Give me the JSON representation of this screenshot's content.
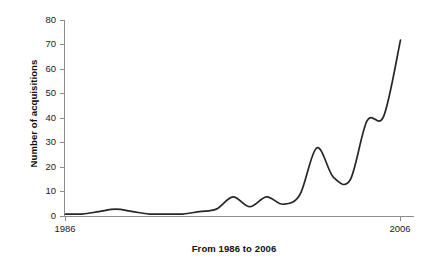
{
  "chart_data": {
    "type": "line",
    "title": "",
    "xlabel": "From 1986 to 2006",
    "ylabel": "Number of acquisitions",
    "xlim": [
      1986,
      2006
    ],
    "ylim": [
      0,
      80
    ],
    "grid": false,
    "legend": false,
    "line_color": "#262626",
    "axis_color": "#808080",
    "background_color": "#ffffff",
    "y_ticks": [
      0,
      10,
      20,
      30,
      40,
      50,
      60,
      70,
      80
    ],
    "y_tick_labels": [
      "0",
      "10",
      "20",
      "30",
      "40",
      "50",
      "60",
      "70",
      "80"
    ],
    "x_ticks": [
      1986,
      2006
    ],
    "x_tick_labels": [
      "1986",
      "2006"
    ],
    "x": [
      1986,
      1987,
      1988,
      1989,
      1990,
      1991,
      1992,
      1993,
      1994,
      1995,
      1996,
      1997,
      1998,
      1999,
      2000,
      2001,
      2002,
      2003,
      2004,
      2005,
      2006
    ],
    "values": [
      1,
      1,
      2,
      3,
      2,
      1,
      1,
      1,
      2,
      3,
      8,
      4,
      8,
      5,
      9,
      28,
      16,
      15,
      39,
      41,
      72
    ],
    "series": [
      {
        "name": "Number of acquisitions",
        "values": [
          1,
          1,
          2,
          3,
          2,
          1,
          1,
          1,
          2,
          3,
          8,
          4,
          8,
          5,
          9,
          28,
          16,
          15,
          39,
          41,
          72
        ]
      }
    ]
  },
  "axes": {
    "y_label_text": "Number of acquisitions",
    "x_label_text": "From 1986 to 2006",
    "y_tick_0": "0",
    "y_tick_10": "10",
    "y_tick_20": "20",
    "y_tick_30": "30",
    "y_tick_40": "40",
    "y_tick_50": "50",
    "y_tick_60": "60",
    "y_tick_70": "70",
    "y_tick_80": "80",
    "x_tick_left": "1986",
    "x_tick_right": "2006"
  }
}
